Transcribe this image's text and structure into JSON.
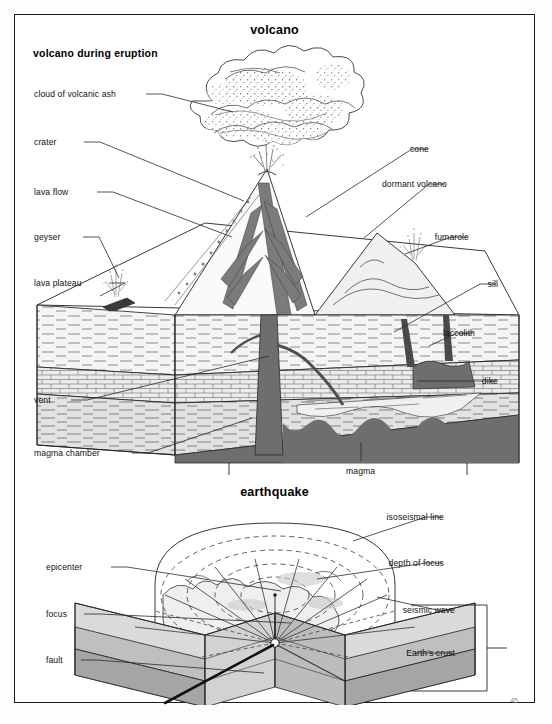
{
  "page": {
    "title": "volcano",
    "section_volcano_subtitle": "volcano during eruption",
    "title_earthquake": "earthquake",
    "page_number": "45"
  },
  "volcano_labels_left": [
    {
      "id": "cloud-of-volcanic-ash",
      "text": "cloud of volcanic ash",
      "x": 33,
      "y": 88,
      "lx": 145,
      "ly": 93,
      "tx": 232,
      "ty": 111
    },
    {
      "id": "crater",
      "text": "crater",
      "x": 33,
      "y": 136,
      "lx": 83,
      "ly": 141,
      "tx": 243,
      "ty": 200
    },
    {
      "id": "lava-flow",
      "text": "lava flow",
      "x": 33,
      "y": 186,
      "lx": 96,
      "ly": 191,
      "tx": 231,
      "ty": 236
    },
    {
      "id": "geyser",
      "text": "geyser",
      "x": 33,
      "y": 231,
      "lx": 82,
      "ly": 236,
      "tx": 118,
      "ty": 277
    },
    {
      "id": "lava-plateau",
      "text": "lava plateau",
      "x": 33,
      "y": 277,
      "lx": 108,
      "ly": 282,
      "tx": 99,
      "ty": 295
    },
    {
      "id": "vent",
      "text": "vent",
      "x": 33,
      "y": 394,
      "lx": 70,
      "ly": 399,
      "tx": 268,
      "ty": 355
    },
    {
      "id": "magma-chamber",
      "text": "magma chamber",
      "x": 33,
      "y": 447,
      "lx": 131,
      "ly": 452,
      "tx": 251,
      "ty": 417
    }
  ],
  "volcano_labels_right": [
    {
      "id": "cone",
      "text": "cone",
      "x": 430,
      "y": 143,
      "lx": 427,
      "ly": 148,
      "tx": 305,
      "ty": 216
    },
    {
      "id": "dormant-volcano",
      "text": "dormant volcano",
      "x": 448,
      "y": 178,
      "lx": 444,
      "ly": 183,
      "tx": 363,
      "ty": 237
    },
    {
      "id": "fumarole",
      "text": "fumarole",
      "x": 470,
      "y": 231,
      "lx": 466,
      "ly": 236,
      "tx": 404,
      "ty": 253
    },
    {
      "id": "sill",
      "text": "sill",
      "x": 499,
      "y": 278,
      "lx": 495,
      "ly": 283,
      "tx": 393,
      "ty": 331
    },
    {
      "id": "laccolith",
      "text": "laccolith",
      "x": 476,
      "y": 327,
      "lx": 472,
      "ly": 332,
      "tx": 428,
      "ty": 345
    },
    {
      "id": "dike",
      "text": "dike",
      "x": 499,
      "y": 375,
      "lx": 495,
      "ly": 380,
      "tx": 416,
      "ty": 380
    }
  ],
  "volcano_labels_center": [
    {
      "id": "magma",
      "text": "magma",
      "x": 345,
      "y": 465,
      "lx": 360,
      "ly": 460,
      "tx": 360,
      "ty": 441
    }
  ],
  "earthquake_labels_left": [
    {
      "id": "epicenter",
      "text": "epicenter",
      "x": 45,
      "y": 561,
      "lx": 110,
      "ly": 566,
      "tx": 280,
      "ty": 590
    },
    {
      "id": "focus",
      "text": "focus",
      "x": 45,
      "y": 608,
      "lx": 83,
      "ly": 613,
      "tx": 290,
      "ty": 622
    },
    {
      "id": "fault",
      "text": "fault",
      "x": 45,
      "y": 654,
      "lx": 80,
      "ly": 659,
      "tx": 263,
      "ty": 672
    }
  ],
  "earthquake_labels_right": [
    {
      "id": "isoseismal-line",
      "text": "isoseismal line",
      "x": 445,
      "y": 511,
      "lx": 441,
      "ly": 516,
      "tx": 352,
      "ty": 540
    },
    {
      "id": "depth-of-focus",
      "text": "depth of focus",
      "x": 445,
      "y": 557,
      "lx": 441,
      "ly": 562,
      "tx": 316,
      "ty": 578
    },
    {
      "id": "seismic-wave",
      "text": "seismic wave",
      "x": 456,
      "y": 604,
      "lx": 452,
      "ly": 609,
      "tx": 376,
      "ty": 596
    },
    {
      "id": "earth-s-crust",
      "text": "Earth's crust",
      "x": 456,
      "y": 647,
      "lx": 452,
      "ly": 652,
      "tx": 414,
      "ty": 652
    }
  ],
  "colors": {
    "ink": "#1a1a1a",
    "leader": "#2a2a2a",
    "magma": "#6e6e6e",
    "magma_dark": "#5d5d5d",
    "strata_light": "#f2f2f2",
    "strata_mid": "#dcdcdc",
    "strata_brick": "#e6e6e6",
    "crust_1": "#dedede",
    "crust_2": "#c2c2c2",
    "crust_3": "#a8a8a8",
    "crust_4": "#949494",
    "ash": "#7a7a7a",
    "cone_face": "#ffffff",
    "cone_shade": "#efefef"
  }
}
